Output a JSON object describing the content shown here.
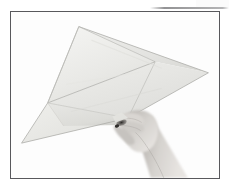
{
  "figure": {
    "kind": "photograph",
    "background_color": "#ffffff",
    "frame": {
      "border_color": "#58585c",
      "border_width_px": 1.5,
      "inner_background": "#fefefe",
      "x": 10,
      "y": 11,
      "width": 210,
      "height": 168
    },
    "artifacts": {
      "top_right_scan_line_color": "#6e6e70",
      "top_right_patch_color": "#fbfbfb"
    },
    "paper": {
      "label": "folded kite paper",
      "base_color": "#e9e9e6",
      "shade_light": "#f2f2f0",
      "shade_mid": "#e2e2df",
      "shade_dark": "#d2d2ce",
      "crease_color": "#bcbcb8",
      "edge_color": "#a8a8a4",
      "vertices": {
        "top_apex": [
          79,
          27
        ],
        "right_tip": [
          208,
          73
        ],
        "mid_right_vertex": [
          155,
          62
        ],
        "left_vertex": [
          48,
          103
        ],
        "bottom_left_tip": [
          22,
          143
        ],
        "bottom_center_vertex": [
          120,
          125
        ],
        "pinch_point": [
          128,
          118
        ]
      }
    },
    "hand": {
      "label": "hand and forearm",
      "skin_light": "#dcd9d6",
      "skin_mid": "#c3bfbb",
      "skin_shadow": "#9b9894",
      "deep_shadow": "#3a3836",
      "pose": "thumb and fingers pinching the lower corner of the paper",
      "orientation": "forearm entering from bottom right edge"
    }
  },
  "accessibility": {
    "alt_text": "Black and white photograph: a hand pinches the bottom corner of a large square sheet of paper folded along its diagonals into a kite-like form."
  }
}
